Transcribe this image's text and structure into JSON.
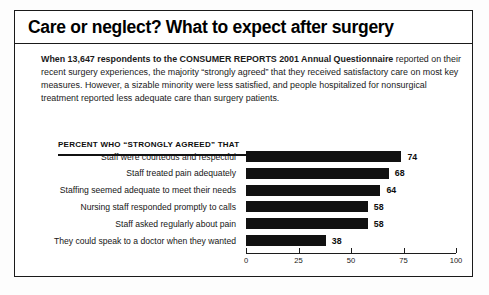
{
  "figure": {
    "title": "Care or neglect? What to expect after surgery",
    "intro_bold": "When 13,647 respondents to the CONSUMER REPORTS 2001 Annual Questionnaire",
    "intro_rest": " reported on their recent surgery experiences, the majority “strongly agreed” that they received satisfactory care on most key measures. However, a sizable minority were less satisfied, and people hospitalized for nonsurgical treatment reported less adequate care than surgery patients.",
    "chart_heading": "PERCENT WHO “STRONGLY AGREED” THAT"
  },
  "chart_data": {
    "type": "bar",
    "orientation": "horizontal",
    "title": "PERCENT WHO “STRONGLY AGREED” THAT",
    "xlabel": "",
    "ylabel": "",
    "xlim": [
      0,
      100
    ],
    "xticks": [
      0,
      25,
      50,
      75,
      100
    ],
    "xtick_labels": [
      "0",
      "25",
      "50",
      "75",
      "100"
    ],
    "grid": false,
    "legend": false,
    "bar_color": "#111111",
    "categories": [
      "Staff were courteous and respectful",
      "Staff treated pain adequately",
      "Staffing seemed adequate to meet their needs",
      "Nursing staff responded promptly to calls",
      "Staff asked regularly about pain",
      "They could speak to a doctor when they wanted"
    ],
    "values": [
      74,
      68,
      64,
      58,
      58,
      38
    ],
    "value_labels": [
      "74",
      "68",
      "64",
      "58",
      "58",
      "38"
    ]
  }
}
